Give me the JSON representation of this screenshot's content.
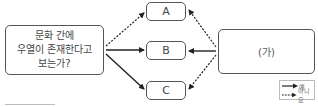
{
  "question_box": {
    "text": "문화 간에\n우열이 존재한다고\n보는가?"
  },
  "options": [
    {
      "id": "A",
      "label": "A"
    },
    {
      "id": "B",
      "label": "B"
    },
    {
      "id": "C",
      "label": "C"
    }
  ],
  "right_box": {
    "label": "(가)"
  },
  "arrows": [
    {
      "from": "question_box",
      "to": "A",
      "style": "dashed",
      "meaning": "아니요"
    },
    {
      "from": "question_box",
      "to": "B",
      "style": "solid",
      "meaning": "예"
    },
    {
      "from": "question_box",
      "to": "C",
      "style": "solid",
      "meaning": "예"
    },
    {
      "from": "right_box",
      "to": "A",
      "style": "dashed",
      "meaning": "아니요"
    },
    {
      "from": "right_box",
      "to": "B",
      "style": "solid",
      "meaning": "예"
    },
    {
      "from": "right_box",
      "to": "C",
      "style": "dashed",
      "meaning": "아니요"
    }
  ],
  "legend": {
    "solid_label": "예",
    "dashed_label": "아니요"
  },
  "colors": {
    "line": "#222222",
    "border": "#555555"
  }
}
